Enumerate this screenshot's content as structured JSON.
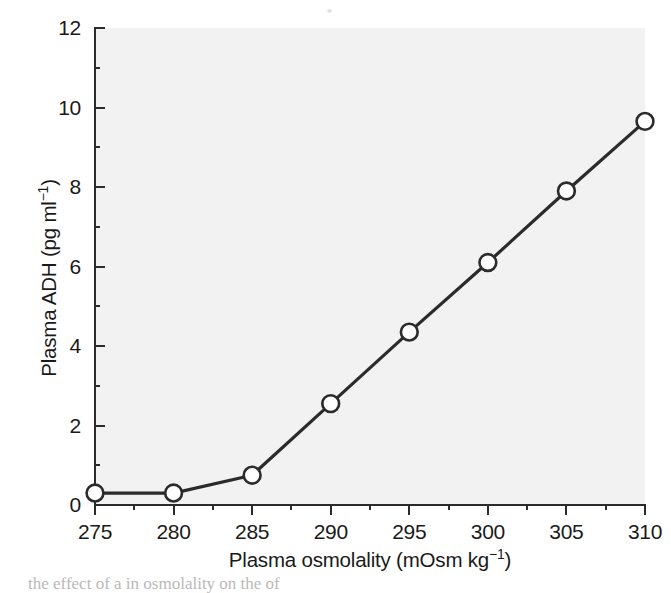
{
  "chart_data": {
    "type": "line",
    "title": "",
    "xlabel": "Plasma osmolality (mOsm kg−1)",
    "ylabel": "Plasma ADH (pg ml−1)",
    "xlim": [
      275,
      310
    ],
    "ylim": [
      0,
      12
    ],
    "grid": false,
    "legend": null,
    "marker": "open-circle",
    "line_color": "#2b2b2b",
    "marker_face_color": "#ffffff",
    "plot_background": "#f2f2f2",
    "x": [
      275,
      280,
      285,
      290,
      295,
      300,
      305,
      310
    ],
    "values": [
      0.3,
      0.3,
      0.75,
      2.55,
      4.35,
      6.1,
      7.9,
      9.65
    ],
    "series": [
      {
        "name": "Plasma ADH",
        "x": [
          275,
          280,
          285,
          290,
          295,
          300,
          305,
          310
        ],
        "values": [
          0.3,
          0.3,
          0.75,
          2.55,
          4.35,
          6.1,
          7.9,
          9.65
        ]
      }
    ],
    "points": [
      {
        "x": 275,
        "y": 0.3
      },
      {
        "x": 280,
        "y": 0.3
      },
      {
        "x": 285,
        "y": 0.75
      },
      {
        "x": 290,
        "y": 2.55
      },
      {
        "x": 295,
        "y": 4.35
      },
      {
        "x": 300,
        "y": 6.1
      },
      {
        "x": 305,
        "y": 7.9
      },
      {
        "x": 310,
        "y": 9.65
      }
    ],
    "x_ticks_major": [
      275,
      280,
      285,
      290,
      295,
      300,
      305,
      310
    ],
    "x_ticks_minor": [
      277.5,
      282.5,
      287.5,
      292.5,
      297.5,
      302.5,
      307.5
    ],
    "y_ticks_major": [
      0,
      2,
      4,
      6,
      8,
      10,
      12
    ],
    "y_ticks_minor": [
      1,
      3,
      5,
      7,
      9,
      11
    ]
  },
  "axes": {
    "y_title_main": "Plasma ADH (pg ml",
    "y_title_exponent": "−1",
    "y_title_close": ")",
    "x_title_main": "Plasma osmolality (mOsm kg",
    "x_title_exponent": "−1",
    "x_title_close": ")",
    "y_tick_labels": [
      "12",
      "10",
      "8",
      "6",
      "4",
      "2",
      "0"
    ],
    "x_tick_labels": [
      "275",
      "280",
      "285",
      "290",
      "295",
      "300",
      "305",
      "310"
    ]
  },
  "caption": {
    "clipped_line": "the effect of a in osmolality on the of"
  }
}
